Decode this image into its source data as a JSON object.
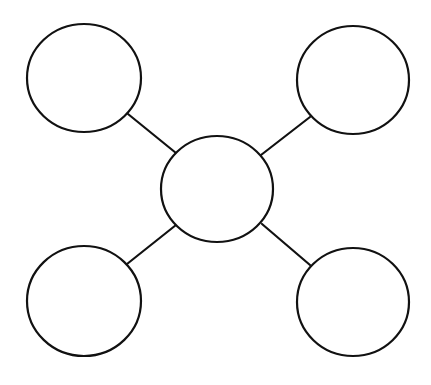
{
  "diagram": {
    "type": "bubble-map",
    "title": "",
    "colors": {
      "stroke": "#111111",
      "fill": "#ffffff",
      "background": "#ffffff",
      "dashed_line": "#6b6b6b"
    },
    "cut_line": {
      "y": 4,
      "x1": 0,
      "x2": 431,
      "style": "dashed"
    },
    "nodes": [
      {
        "id": "center",
        "label": "",
        "cx": 217,
        "cy": 189,
        "rx": 56,
        "ry": 53
      },
      {
        "id": "top-left",
        "label": "",
        "cx": 84,
        "cy": 78,
        "rx": 57,
        "ry": 54
      },
      {
        "id": "top-right",
        "label": "",
        "cx": 353,
        "cy": 80,
        "rx": 56,
        "ry": 54
      },
      {
        "id": "bottom-left",
        "label": "",
        "cx": 84,
        "cy": 301,
        "rx": 57,
        "ry": 55
      },
      {
        "id": "bottom-right",
        "label": "",
        "cx": 353,
        "cy": 302,
        "rx": 56,
        "ry": 54
      }
    ],
    "edges": [
      {
        "from": "top-left",
        "to": "center",
        "x1": 128,
        "y1": 114,
        "x2": 176,
        "y2": 153
      },
      {
        "from": "top-right",
        "to": "center",
        "x1": 310,
        "y1": 117,
        "x2": 261,
        "y2": 155
      },
      {
        "from": "bottom-left",
        "to": "center",
        "x1": 127,
        "y1": 264,
        "x2": 176,
        "y2": 225
      },
      {
        "from": "bottom-right",
        "to": "center",
        "x1": 310,
        "y1": 265,
        "x2": 262,
        "y2": 224
      }
    ]
  }
}
